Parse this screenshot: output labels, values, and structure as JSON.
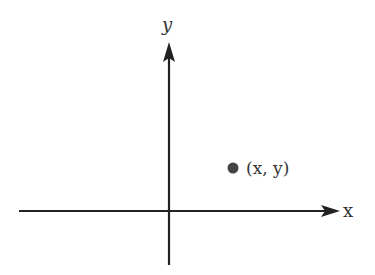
{
  "diagram": {
    "type": "cartesian-coordinate-plane",
    "x_axis_label": "x",
    "y_axis_label": "y",
    "point_label": "(x, y)",
    "colors": {
      "axis": "#222222",
      "point": "#444444",
      "text": "#333333"
    },
    "point_quadrant": "I"
  }
}
